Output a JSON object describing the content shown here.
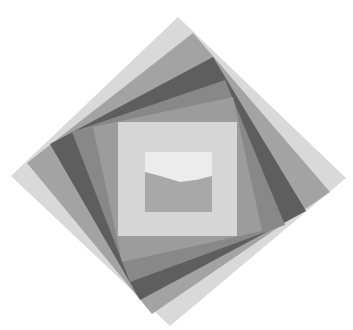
{
  "graphic": {
    "description": "Nested rotating squares logo with image placeholder in center",
    "background": "#ffffff",
    "layers": [
      {
        "name": "outer-square",
        "color": "#d9d9d9",
        "points": "178,17 346,178 170,326 11,176"
      },
      {
        "name": "square-2",
        "color": "#a3a3a3",
        "points": "193,33 330,192 152,314 27,163"
      },
      {
        "name": "square-3",
        "color": "#5e5e5e",
        "points": "213,57 306,211 140,300 50,144"
      },
      {
        "name": "square-4",
        "color": "#888888",
        "points": "225,80 285,225 130,282 72,132"
      },
      {
        "name": "square-5",
        "color": "#9c9c9c",
        "points": "233,97 262,231 122,262 93,127"
      },
      {
        "name": "inner-square",
        "color": "#d6d6d6",
        "points": "118,122 237,122 237,236 118,236"
      }
    ],
    "image_placeholder": {
      "sky_color": "#ececec",
      "sky_points": "145,152 212,152 212,176 196,180 180,182 160,176 145,172",
      "ground_color": "#a8a8a8",
      "ground_points": "145,172 160,176 180,182 196,180 212,176 212,212 145,212"
    }
  }
}
